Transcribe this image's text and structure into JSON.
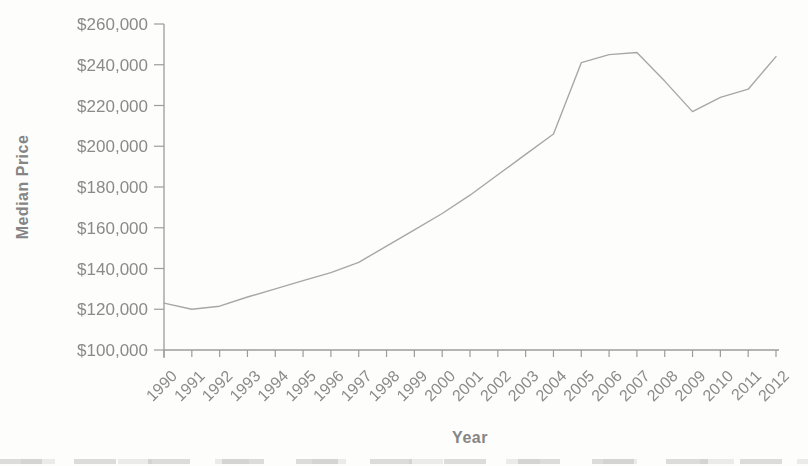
{
  "figure": {
    "background": "#fdfdfc"
  },
  "chart_data": {
    "type": "line",
    "title": "",
    "xlabel": "Year",
    "ylabel": "Median Price",
    "categories": [
      "1990",
      "1991",
      "1992",
      "1993",
      "1994",
      "1995",
      "1996",
      "1997",
      "1998",
      "1999",
      "2000",
      "2001",
      "2002",
      "2003",
      "2004",
      "2005",
      "2006",
      "2007",
      "2008",
      "2009",
      "2010",
      "2011",
      "2012"
    ],
    "values": [
      123000,
      120000,
      121500,
      126000,
      130000,
      134000,
      138000,
      143000,
      151000,
      159000,
      167000,
      176000,
      186000,
      196000,
      206000,
      241000,
      245000,
      246000,
      232000,
      217000,
      224000,
      228000,
      244000
    ],
    "ylim": [
      100000,
      260000
    ],
    "ytick_step": 20000,
    "ytick_labels": [
      "$100,000",
      "$120,000",
      "$140,000",
      "$160,000",
      "$180,000",
      "$200,000",
      "$220,000",
      "$240,000",
      "$260,000"
    ],
    "grid": false,
    "legend": false,
    "x_label_rotation_deg": -45,
    "line_color": "#a7a7a7",
    "axis_color": "#9c9c9c",
    "label_color": "#8a8a8a"
  }
}
